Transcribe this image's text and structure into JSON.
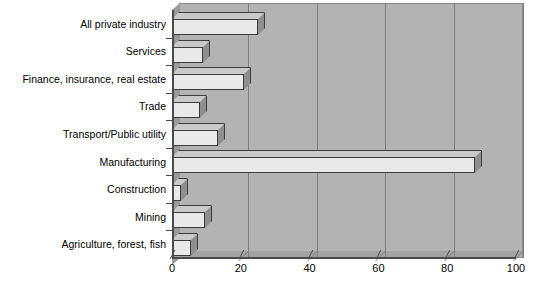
{
  "chart_data": {
    "type": "bar",
    "orientation": "horizontal",
    "title": "",
    "subtitle": "",
    "xlabel": "",
    "ylabel": "",
    "xlim": [
      0,
      100
    ],
    "xticks": [
      0,
      20,
      40,
      60,
      80,
      100
    ],
    "grid": true,
    "legend": null,
    "style": "3d",
    "categories": [
      "All private industry",
      "Services",
      "Finance, insurance, real estate",
      "Trade",
      "Transport/Public utility",
      "Manufacturing",
      "Construction",
      "Mining",
      "Agriculture, forest, fish"
    ],
    "values": [
      25,
      9,
      21,
      8,
      13.5,
      88,
      2.5,
      9.5,
      5.5
    ],
    "colors": {
      "bar_face": "#e9e9e9",
      "bar_top": "#c9c9c9",
      "bar_side": "#8f8f8f",
      "bar_outline": "#3c3c3c",
      "plot_background": "#b3b3b3",
      "wall_side": "#9a9a9a",
      "floor": "#a3a3a3",
      "gridline": "#7e7e7e",
      "axis": "#4a4a4a",
      "page_background": "#ffffff",
      "text": "#000000"
    }
  }
}
